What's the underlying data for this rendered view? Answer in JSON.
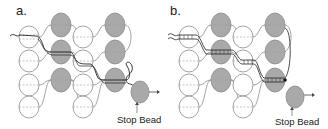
{
  "panels": [
    {
      "label": "a.",
      "stop_bead_label": "Stop Bead",
      "thread_style": "single-loop"
    },
    {
      "label": "b.",
      "stop_bead_label": "Stop Bead",
      "thread_style": "double-pass"
    }
  ],
  "colors": {
    "white_bead_fill": "#ffffff",
    "grey_bead_fill": "#a9a9a9",
    "bead_outline": "#8a8a8a",
    "thread": "#222222"
  }
}
